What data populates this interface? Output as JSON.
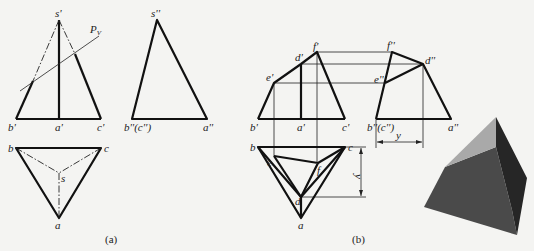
{
  "figure_a": {
    "caption": "(a)",
    "front_view": {
      "labels": {
        "s": "s'",
        "b": "b'",
        "a": "a'",
        "c": "c'",
        "plane": "P",
        "plane_sub": "V"
      }
    },
    "side_view": {
      "labels": {
        "s": "s''",
        "bc": "b''(c'')",
        "a": "a''"
      }
    },
    "top_view": {
      "labels": {
        "b": "b",
        "c": "c",
        "s": "s",
        "a": "a"
      }
    }
  },
  "figure_b": {
    "caption": "(b)",
    "front_view": {
      "labels": {
        "b": "b'",
        "a": "a'",
        "c": "c'",
        "e": "e'",
        "d": "d'",
        "f": "f'"
      }
    },
    "side_view": {
      "labels": {
        "f": "f''",
        "d": "d''",
        "e": "e''",
        "bc": "b''(c'')",
        "a": "a''"
      }
    },
    "top_view": {
      "labels": {
        "b": "b",
        "c": "c",
        "e": "e",
        "f": "f",
        "d": "d",
        "a": "a"
      }
    },
    "dimensions": {
      "y_vertical": "y",
      "y_horizontal": "y"
    }
  },
  "solid_render": {
    "description": "truncated triangular pyramid",
    "colors": {
      "front_face": "#4a4a4a",
      "right_face": "#262626",
      "cut_face": "#a9a9a9"
    }
  }
}
